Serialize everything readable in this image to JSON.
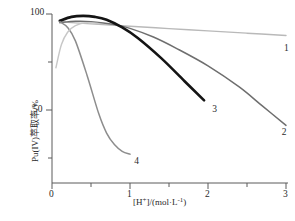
{
  "chart_data": {
    "type": "line",
    "title": "",
    "xlabel": "[H+]/(mol·L-1)",
    "xlabel_parts": {
      "pre": "[H",
      "sup1": "+",
      "mid": "]/(mol·L",
      "sup2": "-1",
      "post": ")"
    },
    "ylabel": "Pu(IV)萃取率/%",
    "xlim": [
      0,
      3
    ],
    "ylim": [
      20,
      100
    ],
    "xticks": [
      0,
      1,
      2,
      3
    ],
    "xtick_labels": [
      "0",
      "1",
      "2",
      "3"
    ],
    "xticks_minor": [
      0.5,
      1.5,
      2.5
    ],
    "yticks": [
      50,
      100
    ],
    "ytick_labels": [
      "50",
      "100"
    ],
    "yticks_minor": [
      25,
      75
    ],
    "grid": false,
    "legend_position": "inline-end-of-curve",
    "series": [
      {
        "name": "1",
        "label": "1",
        "color": "#b9b9b9",
        "label_x": 2.95,
        "label_y": 82,
        "x": [
          0.1,
          0.3,
          0.6,
          1.0,
          1.5,
          2.0,
          2.5,
          3.0
        ],
        "y": [
          96.0,
          95.4,
          94.6,
          93.6,
          92.4,
          91.2,
          90.0,
          88.8
        ]
      },
      {
        "name": "2",
        "label": "2",
        "color": "#6e6e6e",
        "label_x": 2.92,
        "label_y": 38,
        "x": [
          0.1,
          0.3,
          0.5,
          0.8,
          1.0,
          1.3,
          1.6,
          2.0,
          2.4,
          2.7,
          3.0
        ],
        "y": [
          95.5,
          96.2,
          96.0,
          94.5,
          92.5,
          88.0,
          82.0,
          73.0,
          62.0,
          52.0,
          42.0
        ]
      },
      {
        "name": "3",
        "label": "3",
        "color": "#141414",
        "label_x": 2.03,
        "label_y": 50,
        "x": [
          0.1,
          0.25,
          0.4,
          0.55,
          0.7,
          0.9,
          1.1,
          1.4,
          1.7,
          1.95
        ],
        "y": [
          96.5,
          98.5,
          99.0,
          98.5,
          97.0,
          93.0,
          87.5,
          77.0,
          65.0,
          55.0
        ]
      },
      {
        "name": "4",
        "label": "4",
        "color": "#8d8d8d",
        "label_x": 1.03,
        "label_y": 23,
        "x": [
          0.1,
          0.2,
          0.3,
          0.45,
          0.6,
          0.7,
          0.8,
          0.9,
          1.0
        ],
        "y": [
          96.0,
          93.0,
          86.0,
          68.0,
          48.0,
          38.0,
          32.0,
          28.5,
          27.0
        ]
      },
      {
        "name": "1b",
        "label": "",
        "color": "#c7c7c7",
        "label_x": null,
        "label_y": null,
        "x": [
          0.05,
          0.12,
          0.2,
          0.3,
          0.45,
          0.6
        ],
        "y": [
          72.0,
          84.0,
          90.5,
          94.0,
          95.5,
          95.0
        ]
      }
    ]
  },
  "axes": {
    "x_axis_name": "x-axis",
    "y_axis_name": "y-axis"
  }
}
